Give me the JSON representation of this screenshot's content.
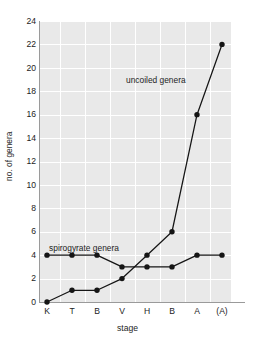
{
  "chart_data": {
    "type": "line",
    "title": "",
    "xlabel": "stage",
    "ylabel": "no. of genera",
    "categories": [
      "K",
      "T",
      "B",
      "V",
      "H",
      "B",
      "A",
      "(A)"
    ],
    "ylim": [
      0,
      24
    ],
    "yticks": [
      0,
      2,
      4,
      6,
      8,
      10,
      12,
      14,
      16,
      18,
      20,
      22,
      24
    ],
    "ytick_labels": [
      "0",
      "2",
      "4",
      "6",
      "8",
      "10",
      "12",
      "14",
      "16",
      "18",
      "20",
      "22",
      "24"
    ],
    "grid": true,
    "legend_position": "inline-annotations",
    "series": [
      {
        "name": "uncoiled genera",
        "label_text": "uncoiled genera",
        "values": [
          0,
          1,
          1,
          2,
          4,
          6,
          16,
          22
        ],
        "marker": "filled-circle",
        "color": "#151515"
      },
      {
        "name": "spirogyrate genera",
        "label_text": "spirogyrate genera",
        "values": [
          4,
          4,
          4,
          3,
          3,
          3,
          4,
          4
        ],
        "marker": "filled-circle",
        "color": "#151515"
      }
    ],
    "annotations": [
      {
        "text": "uncoiled genera",
        "series": "uncoiled genera"
      },
      {
        "text": "spirogyrate genera",
        "series": "spirogyrate genera"
      }
    ],
    "colors": {
      "plot_background": "#e9e9e9",
      "gridline": "#ffffff",
      "axis": "#9a9a9a",
      "line": "#151515",
      "text": "#1d1d1d",
      "page_background": "#ffffff"
    }
  }
}
